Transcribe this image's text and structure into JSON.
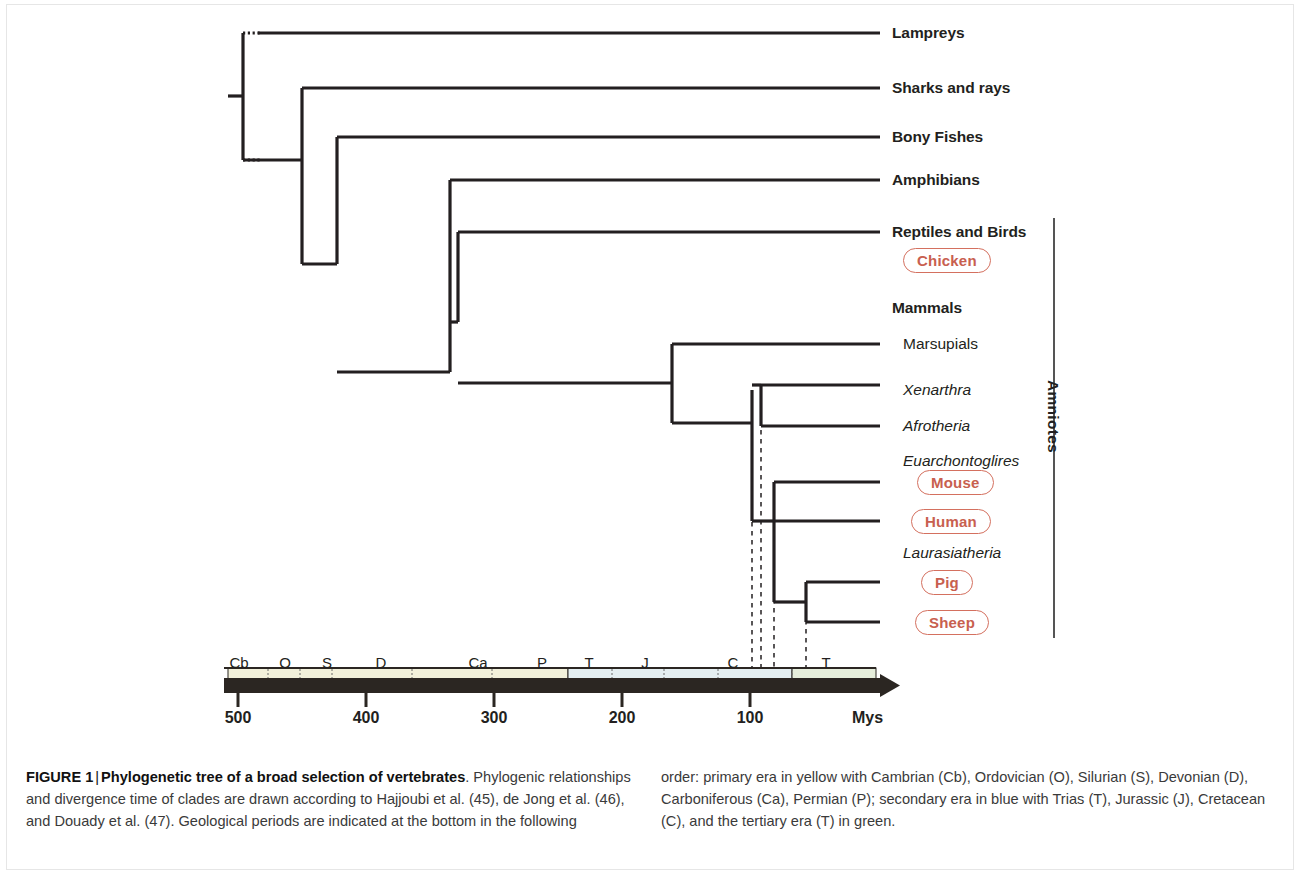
{
  "figure": {
    "label": "FIGURE 1",
    "separator": "|",
    "title_bold": "Phylogenetic tree of a broad selection of vertebrates",
    "caption_left_rest": ". Phylogenic relationships and divergence time of clades are drawn according to Hajjoubi et al. (45), de Jong et al. (46), and Douady et al. (47). Geological periods are indicated at the bottom in the following",
    "caption_right": "order: primary era in yellow with Cambrian (Cb), Ordovician (O), Silurian (S), Devonian (D), Carboniferous (Ca), Permian (P); secondary era in blue with Trias (T), Jurassic (J), Cretacean (C), and the tertiary era (T) in green."
  },
  "bracket": {
    "label": "Amniotes"
  },
  "colors": {
    "branch": "#231f20",
    "species_pill": "#d4705f",
    "species_text": "#c8604f",
    "primary_era": "#f2f0da",
    "secondary_era": "#e4eef1",
    "tertiary_era": "#e6eedc",
    "axis_bar": "#2b2622",
    "dashed_line": "#231f20"
  },
  "tips": [
    {
      "name": "lampreys",
      "label": "Lampreys",
      "style": "bold",
      "x": 892,
      "y": 33,
      "branch_end": 880
    },
    {
      "name": "sharks-and-rays",
      "label": "Sharks and rays",
      "style": "bold",
      "x": 892,
      "y": 88,
      "branch_end": 880
    },
    {
      "name": "bony-fishes",
      "label": "Bony Fishes",
      "style": "bold",
      "x": 892,
      "y": 137,
      "branch_end": 880
    },
    {
      "name": "amphibians",
      "label": "Amphibians",
      "style": "bold",
      "x": 892,
      "y": 180,
      "branch_end": 880
    },
    {
      "name": "reptiles-and-birds",
      "label": "Reptiles and Birds",
      "style": "bold",
      "x": 892,
      "y": 232,
      "branch_end": 880
    },
    {
      "name": "mammals",
      "label": "Mammals",
      "style": "bold",
      "x": 892,
      "y": 308,
      "branch_end": null
    },
    {
      "name": "marsupials",
      "label": "Marsupials",
      "style": "plain",
      "x": 903,
      "y": 344,
      "branch_end": 880
    },
    {
      "name": "xenarthra",
      "label": "Xenarthra",
      "style": "italic",
      "x": 903,
      "y": 390,
      "branch_end": 880
    },
    {
      "name": "afrotheria",
      "label": "Afrotheria",
      "style": "italic",
      "x": 903,
      "y": 426,
      "branch_end": 880
    },
    {
      "name": "euarchontoglires",
      "label": "Euarchontoglires",
      "style": "italic",
      "x": 903,
      "y": 461,
      "branch_end": null
    },
    {
      "name": "laurasiatheria",
      "label": "Laurasiatheria",
      "style": "italic",
      "x": 903,
      "y": 553,
      "branch_end": null
    }
  ],
  "species": [
    {
      "name": "chicken",
      "label": "Chicken",
      "x": 903,
      "y": 248,
      "branch_end": null
    },
    {
      "name": "mouse",
      "label": "Mouse",
      "x": 917,
      "y": 470,
      "branch_end": 880
    },
    {
      "name": "human",
      "label": "Human",
      "x": 911,
      "y": 509,
      "branch_end": 880
    },
    {
      "name": "pig",
      "label": "Pig",
      "x": 921,
      "y": 570,
      "branch_end": 880
    },
    {
      "name": "sheep",
      "label": "Sheep",
      "x": 915,
      "y": 610,
      "branch_end": 880
    }
  ],
  "tree_edges": [
    {
      "name": "root-spine",
      "type": "v",
      "x": 243,
      "y1": 33,
      "y2": 160
    },
    {
      "name": "root-stub",
      "type": "h",
      "y": 96,
      "x1": 228,
      "x2": 243
    },
    {
      "name": "lampreys-branch",
      "type": "h",
      "y": 33,
      "x1": 258,
      "x2": 880
    },
    {
      "name": "node-gnathostomes-v",
      "type": "v",
      "x": 302,
      "y1": 88,
      "y2": 264
    },
    {
      "name": "node-gnathostomes-h",
      "type": "h",
      "y": 160,
      "x1": 243,
      "x2": 302
    },
    {
      "name": "sharks-branch",
      "type": "h",
      "y": 88,
      "x1": 302,
      "x2": 880
    },
    {
      "name": "node-bony-v",
      "type": "v",
      "x": 337,
      "y1": 137,
      "y2": 264
    },
    {
      "name": "node-bony-h",
      "type": "h",
      "y": 264,
      "x1": 302,
      "x2": 337
    },
    {
      "name": "bony-fishes-branch",
      "type": "h",
      "y": 137,
      "x1": 337,
      "x2": 880
    },
    {
      "name": "node-tetrapods-v",
      "type": "v",
      "x": 450,
      "y1": 180,
      "y2": 372
    },
    {
      "name": "node-tetrapods-h",
      "type": "h",
      "y": 372,
      "x1": 337,
      "x2": 450
    },
    {
      "name": "amphibians-branch",
      "type": "h",
      "y": 180,
      "x1": 450,
      "x2": 880
    },
    {
      "name": "node-amniotes-v",
      "type": "v",
      "x": 458,
      "y1": 232,
      "y2": 322
    },
    {
      "name": "node-amniotes-h",
      "type": "h",
      "y": 322,
      "x1": 450,
      "x2": 458
    },
    {
      "name": "reptiles-branch",
      "type": "h",
      "y": 232,
      "x1": 458,
      "x2": 880
    },
    {
      "name": "mammals-stem",
      "type": "h",
      "y": 383,
      "x1": 458,
      "x2": 672
    },
    {
      "name": "node-mammals-v",
      "type": "v",
      "x": 672,
      "y1": 344,
      "y2": 423
    },
    {
      "name": "marsupials-branch",
      "type": "h",
      "y": 344,
      "x1": 672,
      "x2": 880
    },
    {
      "name": "placentals-stem",
      "type": "h",
      "y": 423,
      "x1": 672,
      "x2": 752
    },
    {
      "name": "node-placentals-v",
      "type": "v",
      "x": 752,
      "y1": 390,
      "y2": 521
    },
    {
      "name": "node-atlantogenata-v",
      "type": "v",
      "x": 761,
      "y1": 385,
      "y2": 426
    },
    {
      "name": "node-atlantogenata-h",
      "type": "h",
      "y": 385,
      "x1": 752,
      "x2": 761
    },
    {
      "name": "xenarthra-branch",
      "type": "h",
      "y": 385,
      "x1": 761,
      "x2": 880
    },
    {
      "name": "afrotheria-branch",
      "type": "h",
      "y": 426,
      "x1": 761,
      "x2": 880
    },
    {
      "name": "boreoeutheria-stem",
      "type": "h",
      "y": 521,
      "x1": 752,
      "x2": 774
    },
    {
      "name": "node-euarch-v",
      "type": "v",
      "x": 774,
      "y1": 482,
      "y2": 521
    },
    {
      "name": "mouse-branch",
      "type": "h",
      "y": 482,
      "x1": 774,
      "x2": 880
    },
    {
      "name": "human-branch",
      "type": "h",
      "y": 521,
      "x1": 774,
      "x2": 880
    },
    {
      "name": "laurasiatheria-stem",
      "type": "h",
      "y": 602,
      "x1": 774,
      "x2": 806
    },
    {
      "name": "node-laurasia-v",
      "type": "v",
      "x": 806,
      "y1": 582,
      "y2": 622
    },
    {
      "name": "pig-branch",
      "type": "h",
      "y": 582,
      "x1": 806,
      "x2": 880
    },
    {
      "name": "sheep-branch",
      "type": "h",
      "y": 622,
      "x1": 806,
      "x2": 880
    },
    {
      "name": "euarch-laurasia-link",
      "type": "v",
      "x": 774,
      "y1": 521,
      "y2": 602
    }
  ],
  "dotted_stubs": [
    {
      "name": "root-dotted-lampreys",
      "y": 33,
      "x1": 243,
      "x2": 262
    },
    {
      "name": "root-dotted-lower",
      "y": 160,
      "x1": 243,
      "x2": 262
    }
  ],
  "dashed_drop_lines": [
    {
      "name": "dashed-placentals",
      "x": 752,
      "y1": 423,
      "y2": 668
    },
    {
      "name": "dashed-atlantogenata",
      "x": 761,
      "y1": 385,
      "y2": 668
    },
    {
      "name": "dashed-boreoeutheria",
      "x": 774,
      "y1": 482,
      "y2": 668
    },
    {
      "name": "dashed-laurasiatheria",
      "x": 806,
      "y1": 602,
      "y2": 668
    }
  ],
  "timescale": {
    "axis": {
      "x_start": 224,
      "x_end": 880,
      "arrow_tip": 900,
      "bar_top": 678,
      "bar_height": 15,
      "band_top": 668,
      "band_height": 14,
      "scale_px_per_my": 1.28,
      "origin_x": 238,
      "origin_my": 500
    },
    "eras": [
      {
        "name": "primary-era",
        "color_key": "primary_era",
        "x1": 228,
        "x2": 568
      },
      {
        "name": "secondary-era",
        "color_key": "secondary_era",
        "x1": 568,
        "x2": 792
      },
      {
        "name": "tertiary-era",
        "color_key": "tertiary_era",
        "x1": 792,
        "x2": 876
      }
    ],
    "period_dividers": [
      268,
      300,
      332,
      412,
      492,
      612,
      664,
      718,
      792
    ],
    "periods": [
      {
        "name": "cambrian",
        "letter": "Cb",
        "x": 239
      },
      {
        "name": "ordovician",
        "letter": "O",
        "x": 285
      },
      {
        "name": "silurian",
        "letter": "S",
        "x": 327
      },
      {
        "name": "devonian",
        "letter": "D",
        "x": 381
      },
      {
        "name": "carboniferous",
        "letter": "Ca",
        "x": 478
      },
      {
        "name": "permian",
        "letter": "P",
        "x": 542
      },
      {
        "name": "trias",
        "letter": "T",
        "x": 589
      },
      {
        "name": "jurassic",
        "letter": "J",
        "x": 645
      },
      {
        "name": "cretacean",
        "letter": "C",
        "x": 733
      },
      {
        "name": "tertiary",
        "letter": "T",
        "x": 826
      }
    ],
    "ticks": [
      {
        "name": "tick-500",
        "label": "500",
        "value": 500,
        "x": 238
      },
      {
        "name": "tick-400",
        "label": "400",
        "value": 400,
        "x": 366
      },
      {
        "name": "tick-300",
        "label": "300",
        "value": 300,
        "x": 494
      },
      {
        "name": "tick-200",
        "label": "200",
        "value": 200,
        "x": 622
      },
      {
        "name": "tick-100",
        "label": "100",
        "value": 100,
        "x": 750
      }
    ],
    "unit_label": "Mys"
  },
  "chart_data": {
    "type": "diagram",
    "title": "Phylogenetic tree of a broad selection of vertebrates",
    "xlabel": "Mys",
    "x_axis_direction": "reversed (500 Mya at left to present at right)",
    "xlim": [
      500,
      0
    ],
    "taxa": [
      "Lampreys",
      "Sharks and rays",
      "Bony Fishes",
      "Amphibians",
      "Reptiles and Birds",
      "Marsupials",
      "Xenarthra",
      "Afrotheria",
      "Euarchontoglires",
      "Laurasiatheria"
    ],
    "highlighted_species": [
      "Chicken",
      "Mouse",
      "Human",
      "Pig",
      "Sheep"
    ],
    "divergence_times_mya": [
      {
        "node": "Lampreys vs jawed vertebrates",
        "time": 500
      },
      {
        "node": "Sharks and rays vs bony vertebrates",
        "time": 454
      },
      {
        "node": "Bony Fishes vs tetrapods",
        "time": 427
      },
      {
        "node": "Amphibians vs amniotes",
        "time": 338
      },
      {
        "node": "Reptiles/Birds vs Mammals",
        "time": 332
      },
      {
        "node": "Marsupials vs placentals",
        "time": 161
      },
      {
        "node": "Atlantogenata vs Boreoeutheria",
        "time": 99
      },
      {
        "node": "Xenarthra vs Afrotheria",
        "time": 92
      },
      {
        "node": "Euarchontoglires vs Laurasiatheria",
        "time": 82
      },
      {
        "node": "Mouse vs Human",
        "time": 82
      },
      {
        "node": "Pig vs Sheep",
        "time": 57
      }
    ],
    "geological_periods": [
      {
        "letter": "Cb",
        "name": "Cambrian",
        "era": "primary"
      },
      {
        "letter": "O",
        "name": "Ordovician",
        "era": "primary"
      },
      {
        "letter": "S",
        "name": "Silurian",
        "era": "primary"
      },
      {
        "letter": "D",
        "name": "Devonian",
        "era": "primary"
      },
      {
        "letter": "Ca",
        "name": "Carboniferous",
        "era": "primary"
      },
      {
        "letter": "P",
        "name": "Permian",
        "era": "primary"
      },
      {
        "letter": "T",
        "name": "Trias",
        "era": "secondary"
      },
      {
        "letter": "J",
        "name": "Jurassic",
        "era": "secondary"
      },
      {
        "letter": "C",
        "name": "Cretacean",
        "era": "secondary"
      },
      {
        "letter": "T",
        "name": "Tertiary",
        "era": "tertiary"
      }
    ]
  }
}
